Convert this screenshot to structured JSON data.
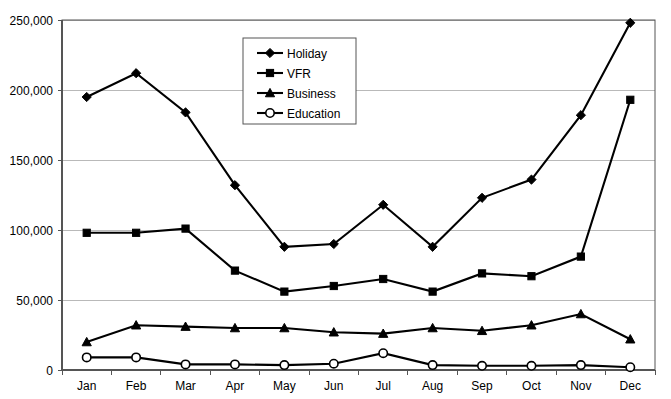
{
  "chart_data": {
    "type": "line",
    "title": "",
    "xlabel": "",
    "ylabel": "",
    "categories": [
      "Jan",
      "Feb",
      "Mar",
      "Apr",
      "May",
      "Jun",
      "Jul",
      "Aug",
      "Sep",
      "Oct",
      "Nov",
      "Dec"
    ],
    "ylim": [
      0,
      250000
    ],
    "ytick_values": [
      0,
      50000,
      100000,
      150000,
      200000,
      250000
    ],
    "ytick_labels": [
      "0",
      "50,000",
      "100,000",
      "150,000",
      "200,000",
      "250,000"
    ],
    "grid": "horizontal",
    "legend_position": "upper-center",
    "series": [
      {
        "name": "Holiday",
        "marker": "diamond",
        "values": [
          195000,
          212000,
          184000,
          132000,
          88000,
          90000,
          118000,
          88000,
          123000,
          136000,
          182000,
          248000
        ]
      },
      {
        "name": "VFR",
        "marker": "square",
        "values": [
          98000,
          98000,
          101000,
          71000,
          56000,
          60000,
          65000,
          56000,
          69000,
          67000,
          81000,
          193000
        ]
      },
      {
        "name": "Business",
        "marker": "triangle",
        "values": [
          20000,
          32000,
          31000,
          30000,
          30000,
          27000,
          26000,
          30000,
          28000,
          32000,
          40000,
          22000
        ]
      },
      {
        "name": "Education",
        "marker": "circle-open",
        "values": [
          9000,
          9000,
          4000,
          4000,
          3500,
          4500,
          12000,
          3500,
          3000,
          3000,
          3500,
          2000
        ]
      }
    ]
  },
  "legend": {
    "items": [
      {
        "label": "Holiday"
      },
      {
        "label": "VFR"
      },
      {
        "label": "Business"
      },
      {
        "label": "Education"
      }
    ]
  },
  "colors": {
    "series": "#000000",
    "grid": "#b9b9b9",
    "axis": "#555555",
    "background": "#ffffff"
  }
}
